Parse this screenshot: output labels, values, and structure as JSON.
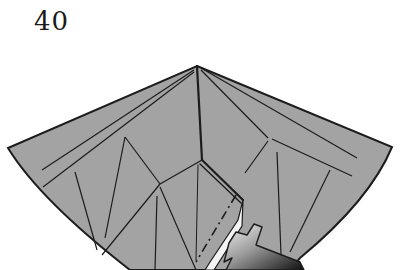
{
  "step": {
    "number": "40"
  },
  "diagram": {
    "paper_color": "#a3a3a3",
    "line_color": "#1c1c1c",
    "background": "#ffffff",
    "arrow": {
      "type": "push-in",
      "gradient": [
        "#ececec",
        "#8a8a8a",
        "#111111"
      ]
    },
    "lines": {
      "valley_fold": "dash-dot",
      "crease": "solid"
    }
  }
}
